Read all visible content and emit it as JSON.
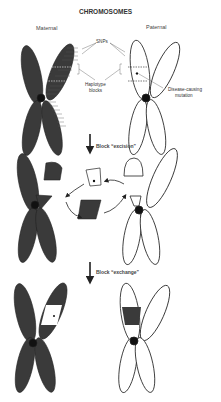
{
  "title": "CHROMOSOMES",
  "headers": {
    "maternal": "Maternal",
    "paternal": "Paternal"
  },
  "annotations": {
    "snps": "SNPs",
    "haplotype_line1": "Haplotype",
    "haplotype_line2": "blocks",
    "mutation_line1": "Disease-causing",
    "mutation_line2": "mutation"
  },
  "steps": {
    "excision": "Block “excision”",
    "exchange": "Block “exchange”"
  },
  "maternal_snps": [
    "1",
    "2",
    "3",
    "4",
    "5",
    "6",
    "7",
    "8",
    "9",
    "10",
    "11",
    "12",
    "13",
    "14",
    "15",
    "16",
    "17"
  ],
  "colors": {
    "maternal_fill": "#3a3a3a",
    "paternal_fill": "#ffffff",
    "stroke": "#222222",
    "text": "#333333"
  }
}
